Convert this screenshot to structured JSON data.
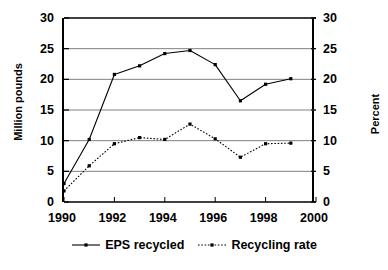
{
  "chart_data": {
    "type": "line",
    "title": "",
    "xlabel": "",
    "ylabel": "Million pounds",
    "y2label": "Percent",
    "x": [
      1990,
      1991,
      1992,
      1993,
      1994,
      1995,
      1996,
      1997,
      1998,
      1999
    ],
    "xlim": [
      1990,
      2000
    ],
    "ylim": [
      0,
      30
    ],
    "y2lim": [
      0,
      30
    ],
    "xticks": [
      "1990",
      "1992",
      "1994",
      "1996",
      "1998",
      "2000"
    ],
    "xtick_values": [
      1990,
      1992,
      1994,
      1996,
      1998,
      2000
    ],
    "yticks": [
      "0",
      "5",
      "10",
      "15",
      "20",
      "25",
      "30"
    ],
    "ytick_values": [
      0,
      5,
      10,
      15,
      20,
      25,
      30
    ],
    "y2ticks": [
      "0",
      "5",
      "10",
      "15",
      "20",
      "25",
      "30"
    ],
    "y2tick_values": [
      0,
      5,
      10,
      15,
      20,
      25,
      30
    ],
    "grid": true,
    "grid_axis": "y",
    "legend_position": "bottom",
    "series": [
      {
        "name": "EPS recycled",
        "axis": "left",
        "linestyle": "solid",
        "marker": "square",
        "color": "#000000",
        "values": [
          3.0,
          10.2,
          20.8,
          22.2,
          24.2,
          24.7,
          22.4,
          16.5,
          19.2,
          20.1
        ]
      },
      {
        "name": "Recycling rate",
        "axis": "right",
        "linestyle": "dotted",
        "marker": "square",
        "color": "#000000",
        "values": [
          1.8,
          5.9,
          9.5,
          10.5,
          10.2,
          12.7,
          10.3,
          7.3,
          9.5,
          9.6
        ]
      }
    ]
  },
  "legend": {
    "items": [
      {
        "label": "EPS recycled"
      },
      {
        "label": "Recycling rate"
      }
    ]
  },
  "colors": {
    "axis": "#000000",
    "grid": "#808080",
    "series_1": "#000000",
    "series_2": "#000000",
    "background": "#ffffff"
  }
}
